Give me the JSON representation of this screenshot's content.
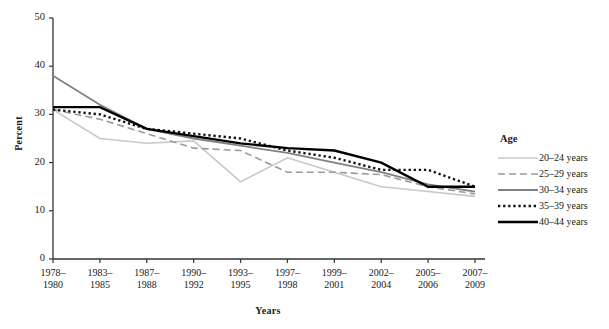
{
  "chart_data": {
    "type": "line",
    "title": "",
    "xlabel": "Years",
    "ylabel": "Percent",
    "ylim": [
      0,
      50
    ],
    "yticks": [
      0,
      10,
      20,
      30,
      40,
      50
    ],
    "grid": false,
    "legend_position": "right",
    "legend_title": "Age",
    "categories": [
      "1978–1980",
      "1983–1985",
      "1987–1988",
      "1990–1992",
      "1993–1995",
      "1997–1998",
      "1999–2001",
      "2002–2004",
      "2005–2006",
      "2007–2009"
    ],
    "category_lines": [
      [
        "1978–",
        "1980"
      ],
      [
        "1983–",
        "1985"
      ],
      [
        "1987–",
        "1988"
      ],
      [
        "1990–",
        "1992"
      ],
      [
        "1993–",
        "1995"
      ],
      [
        "1997–",
        "1998"
      ],
      [
        "1999–",
        "2001"
      ],
      [
        "2002–",
        "2004"
      ],
      [
        "2005–",
        "2006"
      ],
      [
        "2007–",
        "2009"
      ]
    ],
    "series": [
      {
        "name": "20–24 years",
        "color": "#c8c8c8",
        "style": "solid",
        "width": 1.6,
        "values": [
          31,
          25,
          24,
          24.5,
          16,
          21,
          18,
          15,
          14,
          13
        ]
      },
      {
        "name": "25–29 years",
        "color": "#9a9a9a",
        "style": "dashed",
        "width": 1.6,
        "values": [
          31,
          29,
          26,
          23,
          22.5,
          18,
          18,
          17.5,
          15,
          13.5
        ]
      },
      {
        "name": "30–34 years",
        "color": "#808080",
        "style": "solid",
        "width": 1.8,
        "values": [
          38,
          32,
          27,
          25,
          23.5,
          22,
          20,
          18,
          15.5,
          14
        ]
      },
      {
        "name": "35–39 years",
        "color": "#111111",
        "style": "dotted",
        "width": 2.4,
        "values": [
          31,
          30,
          27,
          26,
          25,
          22.5,
          21,
          18.5,
          18.5,
          15
        ]
      },
      {
        "name": "40–44 years",
        "color": "#000000",
        "style": "solid",
        "width": 2.4,
        "values": [
          31.5,
          31.5,
          27,
          25.5,
          24,
          23,
          22.5,
          20,
          15,
          15
        ]
      }
    ]
  }
}
